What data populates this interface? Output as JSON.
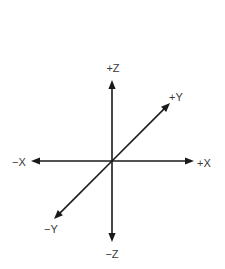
{
  "diagram": {
    "type": "3d-coordinate-axes",
    "origin_label": "",
    "axes": [
      {
        "id": "pos-z",
        "label": "+Z",
        "direction": "up"
      },
      {
        "id": "neg-z",
        "label": "−Z",
        "direction": "down"
      },
      {
        "id": "neg-x",
        "label": "−X",
        "direction": "left"
      },
      {
        "id": "pos-x",
        "label": "+X",
        "direction": "right"
      },
      {
        "id": "pos-y",
        "label": "+Y",
        "direction": "up-right"
      },
      {
        "id": "neg-y",
        "label": "−Y",
        "direction": "down-left"
      }
    ],
    "colors": {
      "line": "#1a1a1a",
      "text": "#3a3a3a",
      "background": "#ffffff"
    }
  }
}
